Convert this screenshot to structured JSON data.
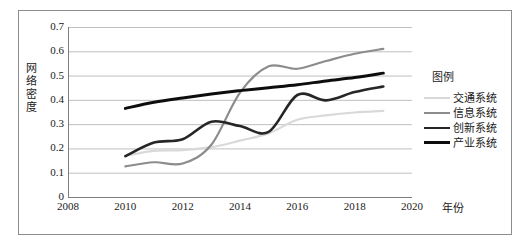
{
  "chart_data": {
    "type": "line",
    "title": "",
    "xlabel": "年份",
    "ylabel": "网络密度",
    "xlim": [
      2008,
      2020
    ],
    "ylim": [
      0,
      0.7
    ],
    "xticks": [
      "2008",
      "2010",
      "2012",
      "2014",
      "2016",
      "2018",
      "2020"
    ],
    "yticks": [
      "0",
      "0.1",
      "0.2",
      "0.3",
      "0.4",
      "0.5",
      "0.6",
      "0.7"
    ],
    "grid": "horizontal",
    "legend_position": "right",
    "legend_title": "图例",
    "x": [
      2010,
      2011,
      2012,
      2013,
      2014,
      2015,
      2016,
      2017,
      2018,
      2019
    ],
    "series": [
      {
        "name": "交通系统",
        "color": "#d9d9d9",
        "width": 2.2,
        "values": [
          0.17,
          0.19,
          0.193,
          0.205,
          0.232,
          0.262,
          0.318,
          0.336,
          0.348,
          0.355
        ]
      },
      {
        "name": "信息系统",
        "color": "#8c8c8c",
        "width": 2.2,
        "values": [
          0.126,
          0.143,
          0.138,
          0.215,
          0.43,
          0.538,
          0.528,
          0.56,
          0.59,
          0.61
        ]
      },
      {
        "name": "创新系统",
        "color": "#262626",
        "width": 2.6,
        "values": [
          0.168,
          0.224,
          0.238,
          0.31,
          0.292,
          0.268,
          0.42,
          0.398,
          0.432,
          0.455
        ]
      },
      {
        "name": "产业系统",
        "color": "#0d0d0d",
        "width": 3.0,
        "values": [
          0.365,
          0.39,
          0.408,
          0.424,
          0.438,
          0.45,
          0.462,
          0.478,
          0.492,
          0.51
        ]
      }
    ]
  }
}
